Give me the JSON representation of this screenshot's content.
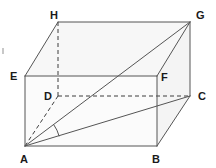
{
  "figure": {
    "name": "cuboid-with-space-diagonal",
    "kind": "geometry-diagram",
    "width": 216,
    "height": 168,
    "background_color": "#ffffff",
    "projection": "oblique",
    "colors": {
      "edge_solid": "#555555",
      "edge_hidden": "#3d3d3d",
      "diagonal": "#555555",
      "label_text": "#1a1a1a",
      "face_front": "#fbfbfb",
      "face_top": "#f7f7f7",
      "face_right": "#f4f4f4"
    },
    "vertices": [
      {
        "label": "A",
        "x": 25,
        "y": 146,
        "label_x": 20,
        "label_y": 163,
        "hidden": false
      },
      {
        "label": "B",
        "x": 157,
        "y": 146,
        "label_x": 152,
        "label_y": 163,
        "hidden": false
      },
      {
        "label": "C",
        "x": 190,
        "y": 96,
        "label_x": 198,
        "label_y": 100,
        "hidden": false
      },
      {
        "label": "D",
        "x": 58,
        "y": 96,
        "label_x": 44,
        "label_y": 100,
        "hidden": true
      },
      {
        "label": "E",
        "x": 25,
        "y": 76,
        "label_x": 10,
        "label_y": 80,
        "hidden": false
      },
      {
        "label": "F",
        "x": 157,
        "y": 76,
        "label_x": 161,
        "label_y": 81,
        "hidden": false
      },
      {
        "label": "G",
        "x": 190,
        "y": 22,
        "label_x": 196,
        "label_y": 19,
        "hidden": false
      },
      {
        "label": "H",
        "x": 58,
        "y": 22,
        "label_x": 50,
        "label_y": 19,
        "hidden": false
      }
    ],
    "edges_visible": [
      {
        "name": "edge-AB",
        "from": "A",
        "to": "B"
      },
      {
        "name": "edge-BF",
        "from": "B",
        "to": "F"
      },
      {
        "name": "edge-FE",
        "from": "F",
        "to": "E"
      },
      {
        "name": "edge-EA",
        "from": "E",
        "to": "A"
      },
      {
        "name": "edge-EH",
        "from": "E",
        "to": "H"
      },
      {
        "name": "edge-HG",
        "from": "H",
        "to": "G"
      },
      {
        "name": "edge-GF",
        "from": "G",
        "to": "F"
      },
      {
        "name": "edge-GC",
        "from": "G",
        "to": "C"
      },
      {
        "name": "edge-CB",
        "from": "C",
        "to": "B"
      }
    ],
    "edges_hidden": [
      {
        "name": "edge-AD",
        "from": "A",
        "to": "D"
      },
      {
        "name": "edge-DH",
        "from": "D",
        "to": "H"
      },
      {
        "name": "edge-DC",
        "from": "D",
        "to": "C"
      }
    ],
    "diagonals": [
      {
        "name": "diagonal-AG",
        "from": "A",
        "to": "G"
      },
      {
        "name": "diagonal-AC",
        "from": "A",
        "to": "C"
      }
    ],
    "angle_marker": {
      "name": "angle-GAC",
      "at_vertex": "A",
      "between": [
        "G",
        "C"
      ],
      "radius": 36
    },
    "faces": [
      {
        "name": "face-front-ABFE",
        "path": "A B F E",
        "fill": "#fbfbfb"
      },
      {
        "name": "face-top-EFGH",
        "path": "E F G H",
        "fill": "#f7f7f7"
      },
      {
        "name": "face-right-BCGF",
        "path": "B C G F",
        "fill": "#f4f4f4"
      }
    ],
    "artifact_speck": {
      "name": "scan-speck",
      "x": 2,
      "y": 48,
      "w": 2,
      "h": 6
    }
  }
}
